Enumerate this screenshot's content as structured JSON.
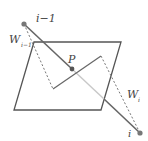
{
  "diagram": {
    "labels": {
      "prev_point": "i−1",
      "point": "i",
      "center": "P",
      "w_prev": "W",
      "w_prev_sub": "i−1",
      "w_curr": "W",
      "w_curr_sub": "i"
    },
    "colors": {
      "line": "#555555",
      "light_line": "#bbbbbb",
      "point": "#777777"
    }
  }
}
